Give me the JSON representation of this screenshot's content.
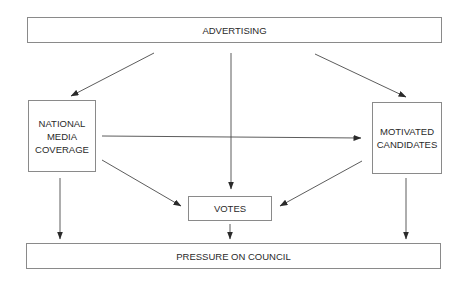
{
  "nodes": {
    "advertising": {
      "lines": [
        "ADVERTISING"
      ]
    },
    "national_media": {
      "lines": [
        "NATIONAL",
        "MEDIA",
        "COVERAGE"
      ]
    },
    "motivated_candidates": {
      "lines": [
        "MOTIVATED",
        "CANDIDATES"
      ]
    },
    "votes": {
      "lines": [
        "VOTES"
      ]
    },
    "pressure": {
      "lines": [
        "PRESSURE ON COUNCIL"
      ]
    }
  },
  "edges": [
    {
      "from": "advertising",
      "to": "national_media"
    },
    {
      "from": "advertising",
      "to": "votes"
    },
    {
      "from": "advertising",
      "to": "motivated_candidates"
    },
    {
      "from": "national_media",
      "to": "motivated_candidates"
    },
    {
      "from": "national_media",
      "to": "votes"
    },
    {
      "from": "motivated_candidates",
      "to": "votes"
    },
    {
      "from": "national_media",
      "to": "pressure"
    },
    {
      "from": "votes",
      "to": "pressure"
    },
    {
      "from": "motivated_candidates",
      "to": "pressure"
    }
  ],
  "colors": {
    "line": "#3a3a3a",
    "box_border": "#8a8a8a",
    "text": "#2a2a2a"
  }
}
